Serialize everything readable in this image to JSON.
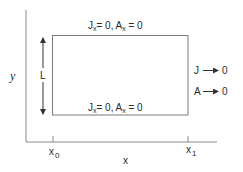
{
  "diagram": {
    "axes": {
      "x_label": "x",
      "y_label": "y",
      "ticks": [
        {
          "base": "x",
          "sub": "0"
        },
        {
          "base": "x",
          "sub": "1"
        }
      ]
    },
    "height_label": "L",
    "top_boundary": {
      "j": "J",
      "j_sub": "x",
      "j_eq": "= 0,",
      "a": "A",
      "a_sub": "x",
      "a_eq": " = 0"
    },
    "bottom_boundary": {
      "j": "J",
      "j_sub": "x",
      "j_eq": "= 0,",
      "a": "A",
      "a_sub": "x",
      "a_eq": " = 0"
    },
    "right_conditions": [
      {
        "var": "J",
        "value": "0"
      },
      {
        "var": "A",
        "value": "0"
      }
    ],
    "colors": {
      "axis": "#8a8a8a",
      "box": "#7a7a7a",
      "text": "#2a2a2a",
      "arrow": "#333333"
    }
  }
}
